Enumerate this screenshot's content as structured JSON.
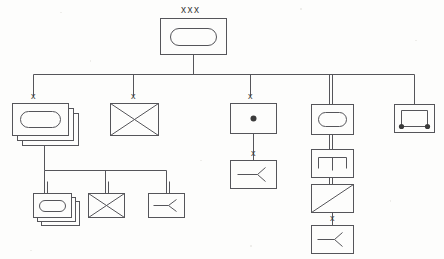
{
  "figure": {
    "type": "tree",
    "canvas": {
      "width": 444,
      "height": 259
    },
    "stroke_color": "#55555a",
    "label_color": "#3b3b3b",
    "background_color": "#fdfdfc"
  },
  "labels": {
    "root": "xxx",
    "node_a": "x",
    "node_b": "x",
    "node_c": "x",
    "node_c_child": "x",
    "node_d_leaf": "x"
  },
  "nodes": [
    {
      "id": "root",
      "name": "root-node",
      "label": "xxx",
      "glyph": "stadium",
      "stacked": false,
      "x": 160,
      "y": 18,
      "w": 66,
      "h": 36
    },
    {
      "id": "a",
      "name": "node-stacked-stadium",
      "label": "x",
      "glyph": "stadium",
      "stacked": true,
      "x": 12,
      "y": 103,
      "w": 56,
      "h": 32
    },
    {
      "id": "b",
      "name": "node-cross",
      "label": "x",
      "glyph": "cross",
      "stacked": false,
      "x": 110,
      "y": 103,
      "w": 48,
      "h": 32
    },
    {
      "id": "c",
      "name": "node-dot",
      "label": "x",
      "glyph": "dot",
      "stacked": false,
      "x": 230,
      "y": 103,
      "w": 46,
      "h": 30
    },
    {
      "id": "d",
      "name": "node-stadium-bus",
      "label": "",
      "glyph": "stadium",
      "stacked": false,
      "x": 311,
      "y": 104,
      "w": 42,
      "h": 30
    },
    {
      "id": "e",
      "name": "node-open-rect-terminals",
      "label": "",
      "glyph": "open-rect-terminals",
      "stacked": false,
      "x": 394,
      "y": 104,
      "w": 40,
      "h": 28
    },
    {
      "id": "a1",
      "name": "node-stacked-stadium-child",
      "label": "",
      "glyph": "stadium",
      "stacked": true,
      "x": 33,
      "y": 193,
      "w": 38,
      "h": 24
    },
    {
      "id": "a2",
      "name": "node-cross-child",
      "label": "",
      "glyph": "cross",
      "stacked": false,
      "x": 88,
      "y": 193,
      "w": 36,
      "h": 24
    },
    {
      "id": "a3",
      "name": "node-fork-child",
      "label": "",
      "glyph": "fork",
      "stacked": false,
      "x": 148,
      "y": 193,
      "w": 36,
      "h": 24
    },
    {
      "id": "c1",
      "name": "node-fork-under-dot",
      "label": "x",
      "glyph": "fork",
      "stacked": false,
      "x": 230,
      "y": 160,
      "w": 46,
      "h": 28
    },
    {
      "id": "d1",
      "name": "node-pi-divider",
      "label": "",
      "glyph": "pi-divider",
      "stacked": false,
      "x": 311,
      "y": 149,
      "w": 42,
      "h": 28
    },
    {
      "id": "d2",
      "name": "node-diagonal",
      "label": "",
      "glyph": "diagonal",
      "stacked": false,
      "x": 311,
      "y": 184,
      "w": 42,
      "h": 28
    },
    {
      "id": "d3",
      "name": "node-fork-bottom",
      "label": "x",
      "glyph": "fork",
      "stacked": false,
      "x": 311,
      "y": 225,
      "w": 42,
      "h": 28
    }
  ],
  "connectors": [
    {
      "name": "root-stem",
      "kind": "single",
      "from": "root",
      "to": "bus-1"
    },
    {
      "name": "bus-level-1",
      "kind": "single",
      "style": "horizontal-bus"
    },
    {
      "name": "drop-to-a",
      "kind": "single",
      "to": "a"
    },
    {
      "name": "drop-to-b",
      "kind": "single",
      "to": "b"
    },
    {
      "name": "drop-to-c",
      "kind": "single",
      "to": "c"
    },
    {
      "name": "drop-to-d",
      "kind": "double",
      "to": "d"
    },
    {
      "name": "drop-to-e",
      "kind": "single",
      "to": "e"
    },
    {
      "name": "a-stem",
      "kind": "single",
      "from": "a",
      "to": "bus-2"
    },
    {
      "name": "bus-level-2",
      "kind": "single",
      "style": "horizontal-bus"
    },
    {
      "name": "drop-to-a1",
      "kind": "double",
      "to": "a1"
    },
    {
      "name": "drop-to-a2",
      "kind": "double",
      "to": "a2"
    },
    {
      "name": "drop-to-a3",
      "kind": "double",
      "to": "a3"
    },
    {
      "name": "c-to-c1",
      "kind": "single",
      "from": "c",
      "to": "c1"
    },
    {
      "name": "d-to-d1",
      "kind": "double",
      "from": "d",
      "to": "d1"
    },
    {
      "name": "d1-to-d2",
      "kind": "double",
      "from": "d1",
      "to": "d2"
    },
    {
      "name": "d2-to-d3",
      "kind": "single",
      "from": "d2",
      "to": "d3"
    }
  ]
}
